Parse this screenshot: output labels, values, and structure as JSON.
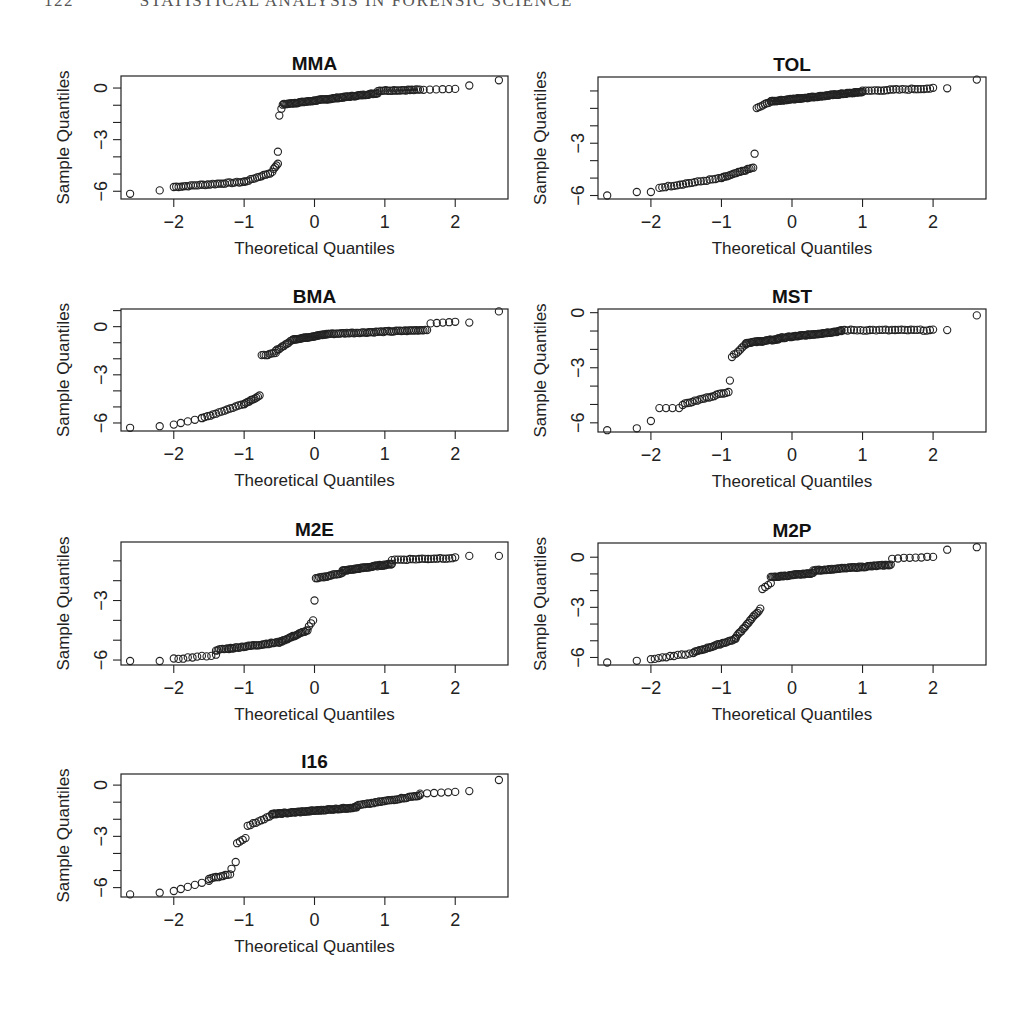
{
  "page": {
    "running_head_page": "122",
    "running_head_title": "STATISTICAL ANALYSIS IN FORENSIC SCIENCE"
  },
  "chart_data": {
    "type": "scatter",
    "subtype": "normal-qq-plot-grid",
    "layout": {
      "rows": 4,
      "cols": 2,
      "panels": 7
    },
    "common": {
      "xlabel": "Theoretical Quantiles",
      "ylabel": "Sample Quantiles",
      "x_ticks": [
        -2,
        -1,
        0,
        1,
        2
      ],
      "x_tick_labels": [
        "−2",
        "−1",
        "0",
        "1",
        "2"
      ],
      "xlim": [
        -2.75,
        2.75
      ],
      "marker": "open-circle",
      "grid": false,
      "legend": false
    },
    "panels": [
      {
        "title": "MMA",
        "box": {
          "x": 121,
          "y": 76,
          "w": 387,
          "h": 123
        },
        "ylim": [
          -6.45,
          0.7
        ],
        "y_ticks": [
          0,
          -1,
          -2,
          -3,
          -4,
          -5,
          -6
        ],
        "y_tick_labels": {
          "0": "0",
          "-3": "−3",
          "-6": "−6"
        },
        "segments": [
          {
            "x": [
              -2.62,
              -2.2
            ],
            "y": [
              -6.15,
              -5.95
            ],
            "n": 2
          },
          {
            "x": [
              -2.0,
              -1.0
            ],
            "y": [
              -5.75,
              -5.45
            ],
            "n": 30
          },
          {
            "x": [
              -1.0,
              -0.6
            ],
            "y": [
              -5.45,
              -4.9
            ],
            "n": 14
          },
          {
            "x": [
              -0.58,
              -0.52
            ],
            "y": [
              -4.7,
              -4.4
            ],
            "n": 4
          },
          {
            "x": [
              -0.52,
              -0.52
            ],
            "y": [
              -3.7,
              -3.7
            ],
            "n": 1
          },
          {
            "x": [
              -0.5,
              -0.47
            ],
            "y": [
              -1.6,
              -1.2
            ],
            "n": 2
          },
          {
            "x": [
              -0.45,
              0.9
            ],
            "y": [
              -0.95,
              -0.3
            ],
            "n": 80
          },
          {
            "x": [
              0.9,
              1.5
            ],
            "y": [
              -0.15,
              -0.1
            ],
            "n": 22
          },
          {
            "x": [
              1.55,
              2.0
            ],
            "y": [
              -0.1,
              -0.05
            ],
            "n": 6
          },
          {
            "x": [
              2.2,
              2.2
            ],
            "y": [
              0.15,
              0.15
            ],
            "n": 1
          },
          {
            "x": [
              2.62,
              2.62
            ],
            "y": [
              0.45,
              0.45
            ],
            "n": 1
          }
        ]
      },
      {
        "title": "TOL",
        "box": {
          "x": 598,
          "y": 77,
          "w": 388,
          "h": 122
        },
        "ylim": [
          -6.2,
          0.8
        ],
        "y_ticks": [
          0,
          -1,
          -2,
          -3,
          -4,
          -5,
          -6
        ],
        "y_tick_labels": {
          "-3": "−3",
          "-6": "−6"
        },
        "segments": [
          {
            "x": [
              -2.62,
              -2.62
            ],
            "y": [
              -6.0,
              -6.0
            ],
            "n": 1
          },
          {
            "x": [
              -2.2,
              -2.0
            ],
            "y": [
              -5.8,
              -5.8
            ],
            "n": 2
          },
          {
            "x": [
              -1.88,
              -1.0
            ],
            "y": [
              -5.55,
              -5.0
            ],
            "n": 22
          },
          {
            "x": [
              -1.0,
              -0.55
            ],
            "y": [
              -5.0,
              -4.4
            ],
            "n": 18
          },
          {
            "x": [
              -0.53,
              -0.53
            ],
            "y": [
              -3.6,
              -3.6
            ],
            "n": 1
          },
          {
            "x": [
              -0.5,
              -0.3
            ],
            "y": [
              -1.0,
              -0.6
            ],
            "n": 8
          },
          {
            "x": [
              -0.3,
              1.0
            ],
            "y": [
              -0.6,
              -0.05
            ],
            "n": 90
          },
          {
            "x": [
              1.0,
              2.0
            ],
            "y": [
              0.0,
              0.15
            ],
            "n": 24
          },
          {
            "x": [
              2.2,
              2.2
            ],
            "y": [
              0.15,
              0.15
            ],
            "n": 1
          },
          {
            "x": [
              2.62,
              2.62
            ],
            "y": [
              0.65,
              0.65
            ],
            "n": 1
          }
        ]
      },
      {
        "title": "BMA",
        "box": {
          "x": 121,
          "y": 309,
          "w": 387,
          "h": 122
        },
        "ylim": [
          -6.5,
          1.1
        ],
        "y_ticks": [
          1,
          0,
          -1,
          -2,
          -3,
          -4,
          -5,
          -6
        ],
        "y_tick_labels": {
          "0": "0",
          "-3": "−3",
          "-6": "−6"
        },
        "segments": [
          {
            "x": [
              -2.62,
              -2.2
            ],
            "y": [
              -6.3,
              -6.2
            ],
            "n": 2
          },
          {
            "x": [
              -2.0,
              -1.6
            ],
            "y": [
              -6.1,
              -5.7
            ],
            "n": 5
          },
          {
            "x": [
              -1.6,
              -1.0
            ],
            "y": [
              -5.7,
              -4.8
            ],
            "n": 16
          },
          {
            "x": [
              -1.0,
              -0.78
            ],
            "y": [
              -4.8,
              -4.3
            ],
            "n": 10
          },
          {
            "x": [
              -0.75,
              -0.55
            ],
            "y": [
              -1.8,
              -1.65
            ],
            "n": 8
          },
          {
            "x": [
              -0.55,
              -0.3
            ],
            "y": [
              -1.5,
              -0.8
            ],
            "n": 12
          },
          {
            "x": [
              -0.3,
              0.2
            ],
            "y": [
              -0.8,
              -0.45
            ],
            "n": 35
          },
          {
            "x": [
              0.2,
              1.6
            ],
            "y": [
              -0.45,
              -0.2
            ],
            "n": 55
          },
          {
            "x": [
              1.65,
              2.0
            ],
            "y": [
              0.2,
              0.3
            ],
            "n": 5
          },
          {
            "x": [
              2.2,
              2.2
            ],
            "y": [
              0.25,
              0.25
            ],
            "n": 1
          },
          {
            "x": [
              2.62,
              2.62
            ],
            "y": [
              0.95,
              0.95
            ],
            "n": 1
          }
        ]
      },
      {
        "title": "MST",
        "box": {
          "x": 598,
          "y": 309,
          "w": 388,
          "h": 123
        },
        "ylim": [
          -6.5,
          0.2
        ],
        "y_ticks": [
          0,
          -1,
          -2,
          -3,
          -4,
          -5,
          -6
        ],
        "y_tick_labels": {
          "0": "0",
          "-3": "−3",
          "-6": "−6"
        },
        "segments": [
          {
            "x": [
              -2.62,
              -2.2
            ],
            "y": [
              -6.4,
              -6.3
            ],
            "n": 2
          },
          {
            "x": [
              -2.0,
              -2.0
            ],
            "y": [
              -5.9,
              -5.9
            ],
            "n": 1
          },
          {
            "x": [
              -1.88,
              -1.6
            ],
            "y": [
              -5.2,
              -5.2
            ],
            "n": 4
          },
          {
            "x": [
              -1.55,
              -0.9
            ],
            "y": [
              -5.0,
              -4.3
            ],
            "n": 20
          },
          {
            "x": [
              -0.88,
              -0.88
            ],
            "y": [
              -3.7,
              -3.7
            ],
            "n": 1
          },
          {
            "x": [
              -0.85,
              -0.65
            ],
            "y": [
              -2.4,
              -1.7
            ],
            "n": 8
          },
          {
            "x": [
              -0.65,
              -0.2
            ],
            "y": [
              -1.65,
              -1.45
            ],
            "n": 28
          },
          {
            "x": [
              -0.2,
              0.7
            ],
            "y": [
              -1.4,
              -1.0
            ],
            "n": 55
          },
          {
            "x": [
              0.7,
              2.0
            ],
            "y": [
              -0.95,
              -0.95
            ],
            "n": 30
          },
          {
            "x": [
              2.2,
              2.2
            ],
            "y": [
              -0.95,
              -0.95
            ],
            "n": 1
          },
          {
            "x": [
              2.62,
              2.62
            ],
            "y": [
              -0.15,
              -0.15
            ],
            "n": 1
          }
        ]
      },
      {
        "title": "M2E",
        "box": {
          "x": 121,
          "y": 542,
          "w": 387,
          "h": 123
        },
        "ylim": [
          -6.25,
          -0.05
        ],
        "y_ticks": [
          -1,
          -2,
          -3,
          -4,
          -5,
          -6
        ],
        "y_tick_labels": {
          "-3": "−3",
          "-6": "−6"
        },
        "segments": [
          {
            "x": [
              -2.62,
              -2.2
            ],
            "y": [
              -6.05,
              -6.05
            ],
            "n": 2
          },
          {
            "x": [
              -2.0,
              -1.4
            ],
            "y": [
              -5.95,
              -5.75
            ],
            "n": 10
          },
          {
            "x": [
              -1.4,
              -0.5
            ],
            "y": [
              -5.5,
              -5.1
            ],
            "n": 40
          },
          {
            "x": [
              -0.5,
              -0.1
            ],
            "y": [
              -5.1,
              -4.5
            ],
            "n": 22
          },
          {
            "x": [
              -0.08,
              -0.02
            ],
            "y": [
              -4.3,
              -4.0
            ],
            "n": 3
          },
          {
            "x": [
              0.0,
              0.0
            ],
            "y": [
              -3.0,
              -3.0
            ],
            "n": 1
          },
          {
            "x": [
              0.02,
              0.4
            ],
            "y": [
              -1.9,
              -1.6
            ],
            "n": 18
          },
          {
            "x": [
              0.4,
              1.1
            ],
            "y": [
              -1.5,
              -1.15
            ],
            "n": 45
          },
          {
            "x": [
              1.1,
              2.0
            ],
            "y": [
              -0.95,
              -0.85
            ],
            "n": 22
          },
          {
            "x": [
              2.2,
              2.2
            ],
            "y": [
              -0.75,
              -0.75
            ],
            "n": 1
          },
          {
            "x": [
              2.62,
              2.62
            ],
            "y": [
              -0.75,
              -0.75
            ],
            "n": 1
          }
        ]
      },
      {
        "title": "M2P",
        "box": {
          "x": 598,
          "y": 543,
          "w": 388,
          "h": 122
        },
        "ylim": [
          -6.45,
          0.85
        ],
        "y_ticks": [
          0,
          -1,
          -2,
          -3,
          -4,
          -5,
          -6
        ],
        "y_tick_labels": {
          "0": "0",
          "-3": "−3",
          "-6": "−6"
        },
        "segments": [
          {
            "x": [
              -2.62,
              -2.2
            ],
            "y": [
              -6.3,
              -6.2
            ],
            "n": 2
          },
          {
            "x": [
              -2.0,
              -1.4
            ],
            "y": [
              -6.1,
              -5.75
            ],
            "n": 12
          },
          {
            "x": [
              -1.4,
              -0.8
            ],
            "y": [
              -5.7,
              -4.9
            ],
            "n": 28
          },
          {
            "x": [
              -0.8,
              -0.45
            ],
            "y": [
              -4.8,
              -3.1
            ],
            "n": 18
          },
          {
            "x": [
              -0.42,
              -0.3
            ],
            "y": [
              -1.9,
              -1.55
            ],
            "n": 4
          },
          {
            "x": [
              -0.3,
              0.3
            ],
            "y": [
              -1.2,
              -0.95
            ],
            "n": 35
          },
          {
            "x": [
              0.3,
              1.4
            ],
            "y": [
              -0.8,
              -0.45
            ],
            "n": 55
          },
          {
            "x": [
              1.42,
              2.0
            ],
            "y": [
              -0.1,
              0.05
            ],
            "n": 8
          },
          {
            "x": [
              2.2,
              2.2
            ],
            "y": [
              0.45,
              0.45
            ],
            "n": 1
          },
          {
            "x": [
              2.62,
              2.62
            ],
            "y": [
              0.6,
              0.6
            ],
            "n": 1
          }
        ]
      },
      {
        "title": "I16",
        "box": {
          "x": 121,
          "y": 774,
          "w": 387,
          "h": 123
        },
        "ylim": [
          -6.55,
          0.65
        ],
        "y_ticks": [
          0,
          -1,
          -2,
          -3,
          -4,
          -5,
          -6
        ],
        "y_tick_labels": {
          "0": "0",
          "-3": "−3",
          "-6": "−6"
        },
        "segments": [
          {
            "x": [
              -2.62,
              -2.2
            ],
            "y": [
              -6.4,
              -6.3
            ],
            "n": 2
          },
          {
            "x": [
              -2.0,
              -1.5
            ],
            "y": [
              -6.2,
              -5.6
            ],
            "n": 6
          },
          {
            "x": [
              -1.5,
              -1.2
            ],
            "y": [
              -5.5,
              -5.2
            ],
            "n": 10
          },
          {
            "x": [
              -1.18,
              -1.12
            ],
            "y": [
              -4.9,
              -4.5
            ],
            "n": 2
          },
          {
            "x": [
              -1.1,
              -0.98
            ],
            "y": [
              -3.4,
              -3.1
            ],
            "n": 4
          },
          {
            "x": [
              -0.95,
              -0.6
            ],
            "y": [
              -2.4,
              -1.75
            ],
            "n": 10
          },
          {
            "x": [
              -0.6,
              0.6
            ],
            "y": [
              -1.7,
              -1.3
            ],
            "n": 70
          },
          {
            "x": [
              0.6,
              1.5
            ],
            "y": [
              -1.2,
              -0.6
            ],
            "n": 35
          },
          {
            "x": [
              1.5,
              2.0
            ],
            "y": [
              -0.5,
              -0.4
            ],
            "n": 6
          },
          {
            "x": [
              2.2,
              2.2
            ],
            "y": [
              -0.35,
              -0.35
            ],
            "n": 1
          },
          {
            "x": [
              2.62,
              2.62
            ],
            "y": [
              0.3,
              0.3
            ],
            "n": 1
          }
        ]
      }
    ]
  }
}
